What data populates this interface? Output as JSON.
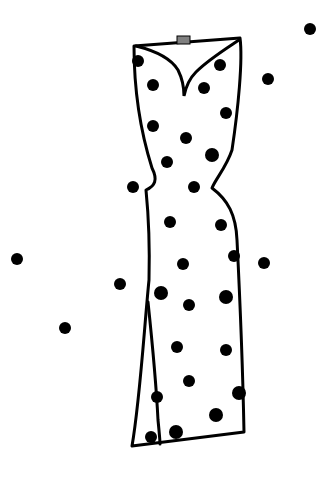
{
  "image": {
    "description": "Line drawing of a sleeveless fitted polka-dot dress with a sweetheart neckline and front slit, with scattered black dots around it",
    "background_color": "#ffffff",
    "line_color": "#000000",
    "dot_color": "#000000",
    "tag_color": "#808080"
  },
  "dress": {
    "outline": "M134,46 L240,38 C243,60 238,110 232,150 C226,168 216,178 212,188 C228,200 236,215 237,240 C240,300 243,380 244,432 L132,446 C140,400 144,330 149,280 C150,240 148,210 146,190 C155,186 158,180 152,168 C140,130 134,90 134,46 Z",
    "neckline": "M136,46 C160,52 172,60 178,70 C182,78 184,86 184,96 C186,86 190,78 196,72 C208,60 224,50 239,40",
    "slit": "M148,302 C152,340 156,380 158,420 C159,430 160,440 160,444",
    "tag": {
      "x": 177,
      "y": 36,
      "w": 13,
      "h": 8
    }
  },
  "dots": [
    {
      "x": 310,
      "y": 29,
      "r": 6
    },
    {
      "x": 138,
      "y": 61,
      "r": 6
    },
    {
      "x": 220,
      "y": 65,
      "r": 6
    },
    {
      "x": 268,
      "y": 79,
      "r": 6
    },
    {
      "x": 153,
      "y": 85,
      "r": 6
    },
    {
      "x": 204,
      "y": 88,
      "r": 6
    },
    {
      "x": 226,
      "y": 113,
      "r": 6
    },
    {
      "x": 153,
      "y": 126,
      "r": 6
    },
    {
      "x": 186,
      "y": 138,
      "r": 6
    },
    {
      "x": 212,
      "y": 155,
      "r": 7
    },
    {
      "x": 167,
      "y": 162,
      "r": 6
    },
    {
      "x": 133,
      "y": 187,
      "r": 6
    },
    {
      "x": 194,
      "y": 187,
      "r": 6
    },
    {
      "x": 170,
      "y": 222,
      "r": 6
    },
    {
      "x": 221,
      "y": 225,
      "r": 6
    },
    {
      "x": 234,
      "y": 256,
      "r": 6
    },
    {
      "x": 17,
      "y": 259,
      "r": 6
    },
    {
      "x": 264,
      "y": 263,
      "r": 6
    },
    {
      "x": 183,
      "y": 264,
      "r": 6
    },
    {
      "x": 120,
      "y": 284,
      "r": 6
    },
    {
      "x": 161,
      "y": 293,
      "r": 7
    },
    {
      "x": 226,
      "y": 297,
      "r": 7
    },
    {
      "x": 189,
      "y": 305,
      "r": 6
    },
    {
      "x": 65,
      "y": 328,
      "r": 6
    },
    {
      "x": 177,
      "y": 347,
      "r": 6
    },
    {
      "x": 226,
      "y": 350,
      "r": 6
    },
    {
      "x": 189,
      "y": 381,
      "r": 6
    },
    {
      "x": 239,
      "y": 393,
      "r": 7
    },
    {
      "x": 157,
      "y": 397,
      "r": 6
    },
    {
      "x": 216,
      "y": 415,
      "r": 7
    },
    {
      "x": 151,
      "y": 437,
      "r": 6
    },
    {
      "x": 176,
      "y": 432,
      "r": 7
    }
  ]
}
